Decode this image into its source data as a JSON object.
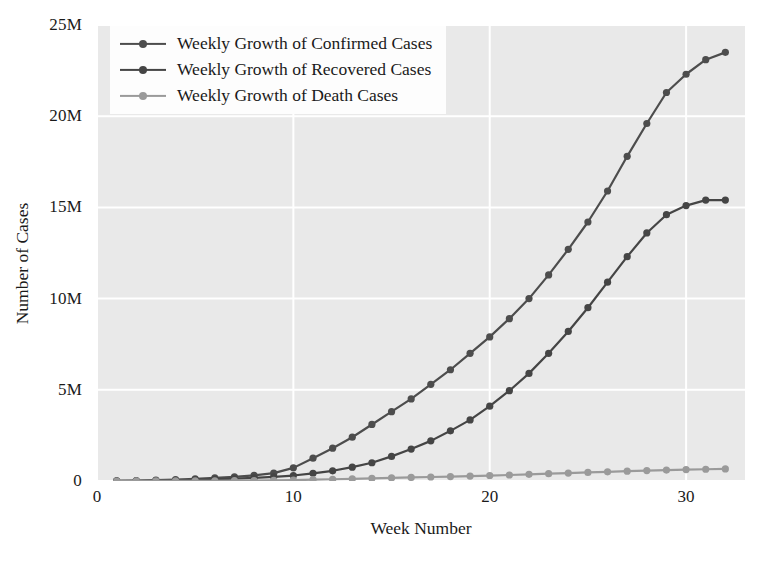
{
  "chart_data": {
    "type": "line",
    "title": "",
    "xlabel": "Week Number",
    "ylabel": "Number of Cases",
    "xlim": [
      0,
      33
    ],
    "ylim": [
      0,
      25000000
    ],
    "xticks": [
      0,
      10,
      20,
      30
    ],
    "xticklabels": [
      "0",
      "10",
      "20",
      "30"
    ],
    "yticks": [
      0,
      5000000,
      10000000,
      15000000,
      20000000,
      25000000
    ],
    "yticklabels": [
      "0",
      "5M",
      "10M",
      "15M",
      "20M",
      "25M"
    ],
    "grid": true,
    "legend_position": "upper left",
    "x": [
      1,
      2,
      3,
      4,
      5,
      6,
      7,
      8,
      9,
      10,
      11,
      12,
      13,
      14,
      15,
      16,
      17,
      18,
      19,
      20,
      21,
      22,
      23,
      24,
      25,
      26,
      27,
      28,
      29,
      30,
      31,
      32
    ],
    "series": [
      {
        "name": "Weekly Growth of Confirmed Cases",
        "color": "#4d4d4d",
        "marker": "circle",
        "values": [
          10000,
          25000,
          45000,
          80000,
          120000,
          170000,
          230000,
          310000,
          430000,
          720000,
          1250000,
          1800000,
          2400000,
          3100000,
          3800000,
          4500000,
          5300000,
          6100000,
          7000000,
          7900000,
          8900000,
          10000000,
          11300000,
          12700000,
          14200000,
          15900000,
          17800000,
          19600000,
          21300000,
          22300000,
          23100000,
          23500000
        ]
      },
      {
        "name": "Weekly Growth of Recovered Cases",
        "color": "#454545",
        "marker": "circle",
        "values": [
          5000,
          12000,
          22000,
          40000,
          62000,
          90000,
          125000,
          170000,
          230000,
          300000,
          420000,
          560000,
          760000,
          1000000,
          1350000,
          1750000,
          2200000,
          2750000,
          3350000,
          4100000,
          4950000,
          5900000,
          7000000,
          8200000,
          9500000,
          10900000,
          12300000,
          13600000,
          14600000,
          15100000,
          15400000,
          15400000
        ]
      },
      {
        "name": "Weekly Growth of Death Cases",
        "color": "#9a9a9a",
        "marker": "circle",
        "values": [
          1000,
          2000,
          3500,
          6000,
          9000,
          13000,
          18000,
          24000,
          32000,
          45000,
          70000,
          95000,
          120000,
          145000,
          170000,
          195000,
          220000,
          245000,
          270000,
          300000,
          330000,
          365000,
          400000,
          435000,
          470000,
          505000,
          540000,
          570000,
          600000,
          625000,
          645000,
          660000
        ]
      }
    ]
  },
  "style": {
    "plot_background": "#e9e9e9",
    "grid_color": "#ffffff",
    "figure_background": "#ffffff",
    "legend_background": "#fdfdfd",
    "text_color": "#1a1a1a"
  }
}
